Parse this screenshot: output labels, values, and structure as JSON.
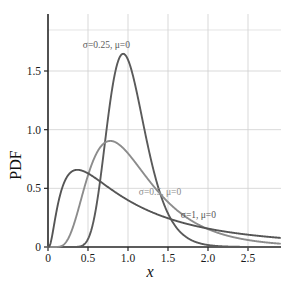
{
  "chart_data": {
    "type": "line",
    "title": "",
    "xlabel": "x",
    "ylabel": "PDF",
    "xlim": [
      0,
      2.9
    ],
    "ylim": [
      -0.06,
      1.78
    ],
    "grid": true,
    "legend_position": "inline-annotations",
    "xticks": [
      0,
      0.5,
      1.0,
      1.5,
      2.0,
      2.5
    ],
    "xticklabels": [
      "0",
      "0.5",
      "1.0",
      "1.5",
      "2.0",
      "2.5"
    ],
    "yticks": [
      0,
      0.5,
      1.0,
      1.5
    ],
    "yticklabels": [
      "0",
      "0.5",
      "1.0",
      "1.5"
    ],
    "distribution": "log-normal",
    "series": [
      {
        "name": "sigma-0.25",
        "label": "σ=0.25, μ=0",
        "sigma": 0.25,
        "mu": 0,
        "color": "#5a5a5a",
        "peak_x": 0.94,
        "peak_y": 1.645,
        "label_x": 0.73,
        "label_y": 1.695,
        "x": [
          0.0,
          0.1,
          0.2,
          0.3,
          0.4,
          0.5,
          0.6,
          0.7,
          0.8,
          0.9,
          0.94,
          1.0,
          1.1,
          1.2,
          1.3,
          1.4,
          1.5,
          1.6,
          1.8,
          2.0,
          2.2,
          2.5,
          2.9
        ],
        "y": [
          0.0,
          0.0,
          0.0016,
          0.0541,
          0.3224,
          0.8067,
          1.3023,
          1.5861,
          1.6447,
          1.5692,
          1.5455,
          1.4128,
          1.2174,
          1.0206,
          0.8433,
          0.6912,
          0.5643,
          0.4602,
          0.3064,
          0.2046,
          0.1383,
          0.0761,
          0.0323
        ]
      },
      {
        "name": "sigma-0.5",
        "label": "σ=0.5, μ=0",
        "sigma": 0.5,
        "mu": 0,
        "color": "#8c8c8c",
        "peak_x": 0.78,
        "peak_y": 0.9,
        "label_x": 1.4,
        "label_y": 0.44,
        "x": [
          0.0,
          0.1,
          0.2,
          0.3,
          0.4,
          0.5,
          0.6,
          0.7,
          0.78,
          0.9,
          1.0,
          1.1,
          1.2,
          1.4,
          1.5,
          1.6,
          1.8,
          2.0,
          2.2,
          2.5,
          2.9
        ],
        "y": [
          0.0,
          0.0108,
          0.1093,
          0.2885,
          0.4865,
          0.6448,
          0.7528,
          0.8179,
          0.8986,
          0.872,
          0.7979,
          0.7729,
          0.7342,
          0.6374,
          0.5886,
          0.5415,
          0.4554,
          0.3815,
          0.3192,
          0.2445,
          0.1658
        ]
      },
      {
        "name": "sigma-1",
        "label": "σ=1, μ=0",
        "sigma": 1,
        "mu": 0,
        "color": "#555555",
        "peak_x": 0.37,
        "peak_y": 0.658,
        "label_x": 1.88,
        "label_y": 0.245,
        "x": [
          0.0,
          0.05,
          0.1,
          0.15,
          0.2,
          0.25,
          0.3,
          0.37,
          0.45,
          0.5,
          0.6,
          0.7,
          0.8,
          0.9,
          1.0,
          1.2,
          1.4,
          1.6,
          1.8,
          2.0,
          2.2,
          2.5,
          2.9
        ],
        "y": [
          0.0,
          0.0354,
          0.282,
          0.4767,
          0.5835,
          0.6371,
          0.6578,
          0.6577,
          0.6301,
          0.6109,
          0.5684,
          0.5246,
          0.4831,
          0.4456,
          0.3989,
          0.3452,
          0.2971,
          0.2555,
          0.2214,
          0.1932,
          0.1697,
          0.1417,
          0.1132
        ]
      }
    ]
  },
  "axes": {
    "y_axis_name": "PDF",
    "x_axis_name": "x"
  }
}
